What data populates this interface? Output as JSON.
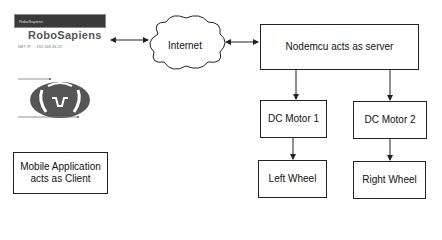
{
  "app_screenshot": {
    "header_label": "RoboSapiens",
    "title": "RoboSapiens",
    "ip_label": "NET IP",
    "ip_value": "192.168.43.22"
  },
  "client_box": {
    "label": "Mobile Application acts as Client"
  },
  "cloud": {
    "label": "Internet"
  },
  "server_box": {
    "label": "Nodemcu acts as server"
  },
  "motors": [
    {
      "label": "DC Motor 1"
    },
    {
      "label": "DC Motor 2"
    }
  ],
  "wheels": [
    {
      "label": "Left Wheel"
    },
    {
      "label": "Right Wheel"
    }
  ],
  "colors": {
    "line": "#222222",
    "logo": "#555555",
    "app_bar": "#3a3a3a"
  }
}
